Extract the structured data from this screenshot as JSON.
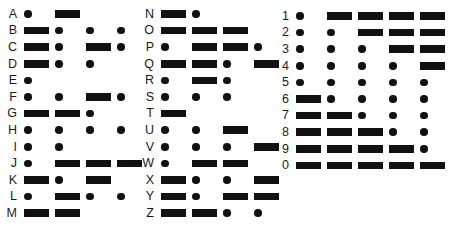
{
  "chart_title": "International Morse Code Chart",
  "colors": {
    "background": "#ffffff",
    "ink": "#111111",
    "label_text": "#1a1a1a"
  },
  "glyphs": {
    "dot_name": "morse-dot",
    "dash_name": "morse-dash",
    "dot_char": ".",
    "dash_char": "-"
  },
  "columns": [
    {
      "name": "column-a-m",
      "x": 0,
      "entries": [
        {
          "label": "A",
          "code": ".-",
          "symbols": [
            "dot",
            "dash"
          ]
        },
        {
          "label": "B",
          "code": "-...",
          "symbols": [
            "dash",
            "dot",
            "dot",
            "dot"
          ]
        },
        {
          "label": "C",
          "code": "-.-.",
          "symbols": [
            "dash",
            "dot",
            "dash",
            "dot"
          ]
        },
        {
          "label": "D",
          "code": "-..",
          "symbols": [
            "dash",
            "dot",
            "dot"
          ]
        },
        {
          "label": "E",
          "code": ".",
          "symbols": [
            "dot"
          ]
        },
        {
          "label": "F",
          "code": "..-.",
          "symbols": [
            "dot",
            "dot",
            "dash",
            "dot"
          ]
        },
        {
          "label": "G",
          "code": "--.",
          "symbols": [
            "dash",
            "dash",
            "dot"
          ]
        },
        {
          "label": "H",
          "code": "....",
          "symbols": [
            "dot",
            "dot",
            "dot",
            "dot"
          ]
        },
        {
          "label": "I",
          "code": "..",
          "symbols": [
            "dot",
            "dot"
          ]
        },
        {
          "label": "J",
          "code": ".---",
          "symbols": [
            "dot",
            "dash",
            "dash",
            "dash"
          ]
        },
        {
          "label": "K",
          "code": "-.-",
          "symbols": [
            "dash",
            "dot",
            "dash"
          ]
        },
        {
          "label": "L",
          "code": ".-..",
          "symbols": [
            "dot",
            "dash",
            "dot",
            "dot"
          ]
        },
        {
          "label": "M",
          "code": "--",
          "symbols": [
            "dash",
            "dash"
          ]
        }
      ]
    },
    {
      "name": "column-n-z",
      "x": 137,
      "entries": [
        {
          "label": "N",
          "code": "-.",
          "symbols": [
            "dash",
            "dot"
          ]
        },
        {
          "label": "O",
          "code": "---",
          "symbols": [
            "dash",
            "dash",
            "dash"
          ]
        },
        {
          "label": "P",
          "code": ".--.",
          "symbols": [
            "dot",
            "dash",
            "dash",
            "dot"
          ]
        },
        {
          "label": "Q",
          "code": "--.-",
          "symbols": [
            "dash",
            "dash",
            "dot",
            "dash"
          ]
        },
        {
          "label": "R",
          "code": ".-.",
          "symbols": [
            "dot",
            "dash",
            "dot"
          ]
        },
        {
          "label": "S",
          "code": "...",
          "symbols": [
            "dot",
            "dot",
            "dot"
          ]
        },
        {
          "label": "T",
          "code": "-",
          "symbols": [
            "dash"
          ]
        },
        {
          "label": "U",
          "code": "..-",
          "symbols": [
            "dot",
            "dot",
            "dash"
          ]
        },
        {
          "label": "V",
          "code": "...-",
          "symbols": [
            "dot",
            "dot",
            "dot",
            "dash"
          ]
        },
        {
          "label": "W",
          "code": ".--",
          "symbols": [
            "dot",
            "dash",
            "dash"
          ]
        },
        {
          "label": "X",
          "code": "-..-",
          "symbols": [
            "dash",
            "dot",
            "dot",
            "dash"
          ]
        },
        {
          "label": "Y",
          "code": "-.--",
          "symbols": [
            "dash",
            "dot",
            "dash",
            "dash"
          ]
        },
        {
          "label": "Z",
          "code": "--..",
          "symbols": [
            "dash",
            "dash",
            "dot",
            "dot"
          ]
        }
      ]
    },
    {
      "name": "column-digits",
      "x": 272,
      "entries": [
        {
          "label": "1",
          "code": ".----",
          "symbols": [
            "dot",
            "dash",
            "dash",
            "dash",
            "dash"
          ]
        },
        {
          "label": "2",
          "code": "..---",
          "symbols": [
            "dot",
            "dot",
            "dash",
            "dash",
            "dash"
          ]
        },
        {
          "label": "3",
          "code": "...--",
          "symbols": [
            "dot",
            "dot",
            "dot",
            "dash",
            "dash"
          ]
        },
        {
          "label": "4",
          "code": "....-",
          "symbols": [
            "dot",
            "dot",
            "dot",
            "dot",
            "dash"
          ]
        },
        {
          "label": "5",
          "code": ".....",
          "symbols": [
            "dot",
            "dot",
            "dot",
            "dot",
            "dot"
          ]
        },
        {
          "label": "6",
          "code": "-....",
          "symbols": [
            "dash",
            "dot",
            "dot",
            "dot",
            "dot"
          ]
        },
        {
          "label": "7",
          "code": "--...",
          "symbols": [
            "dash",
            "dash",
            "dot",
            "dot",
            "dot"
          ]
        },
        {
          "label": "8",
          "code": "---..",
          "symbols": [
            "dash",
            "dash",
            "dash",
            "dot",
            "dot"
          ]
        },
        {
          "label": "9",
          "code": "----.",
          "symbols": [
            "dash",
            "dash",
            "dash",
            "dash",
            "dot"
          ]
        },
        {
          "label": "0",
          "code": "-----",
          "symbols": [
            "dash",
            "dash",
            "dash",
            "dash",
            "dash"
          ]
        }
      ]
    }
  ],
  "layout": {
    "row_pitch": 16.6,
    "first_row_top_letters": 6,
    "first_row_top_digits": 8
  }
}
